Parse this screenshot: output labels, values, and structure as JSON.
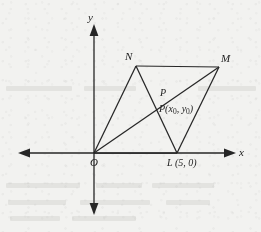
{
  "figure": {
    "type": "coordinate-geometry-diagram",
    "background_color": "#f2f2f0",
    "line_color": "#262626",
    "axes": {
      "x_axis_label": "x",
      "y_axis_label": "y",
      "origin_label": "O",
      "x_axis_arrows": "both",
      "y_axis_arrows": "both"
    },
    "vertices": [
      {
        "name": "N",
        "label": "N",
        "px": 136,
        "py": 66
      },
      {
        "name": "M",
        "label": "M",
        "px": 219,
        "py": 67
      },
      {
        "name": "L",
        "label": "L (5, 0)",
        "px": 177,
        "py": 153
      },
      {
        "name": "O",
        "label": "O",
        "px": 94,
        "py": 153
      }
    ],
    "intersection": {
      "name": "P",
      "label": "P",
      "coordinate_label_prefix": "P(x",
      "coordinate_label_sub1": "0",
      "coordinate_label_mid": ", y",
      "coordinate_label_sub2": "0",
      "coordinate_label_suffix": ")",
      "px": 157,
      "py": 109
    },
    "labels": {
      "y_axis": "y",
      "x_axis": "x",
      "origin": "O",
      "vertex_n": "N",
      "vertex_m": "M",
      "vertex_l": "L (5, 0)",
      "point_p": "P"
    }
  }
}
